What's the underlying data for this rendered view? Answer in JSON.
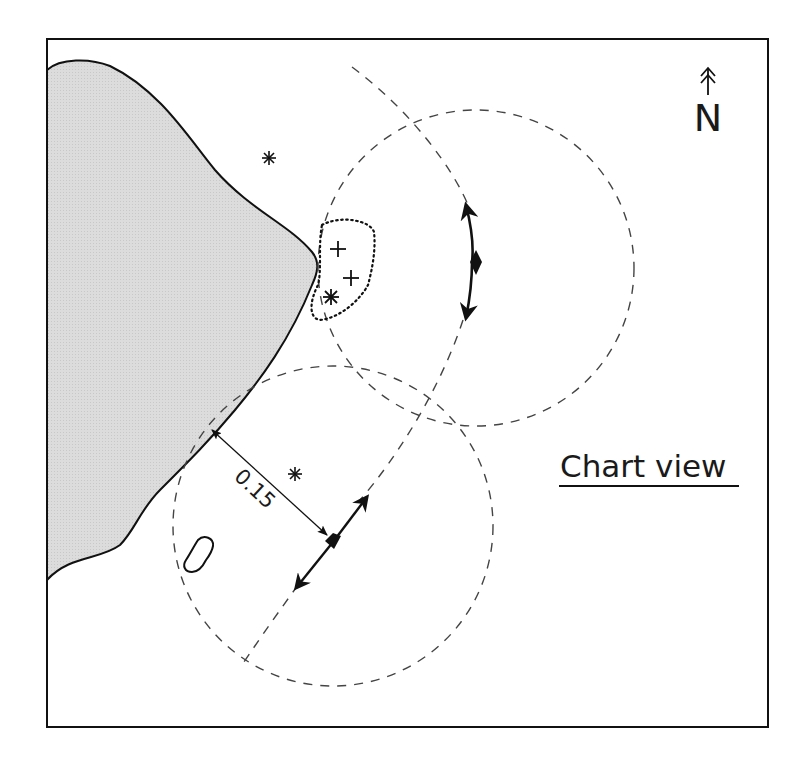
{
  "title": "Chart view",
  "compass": {
    "label": "N",
    "icon": "north-arrow-icon"
  },
  "distance_label": "0.15",
  "colors": {
    "land": "#d9d9d9",
    "ink": "#111111",
    "dash": "#444444",
    "background": "#ffffff"
  },
  "symbols": {
    "asterisks": 3,
    "crosses": 2,
    "vessel_positions": 2
  }
}
